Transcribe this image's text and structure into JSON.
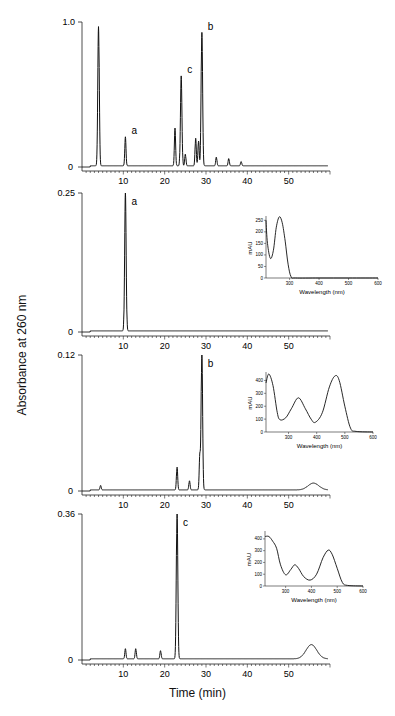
{
  "figure": {
    "ylabel": "Absorbance at 260 nm",
    "xlabel": "Time (min)"
  },
  "chart_data": [
    {
      "type": "line",
      "panel": 1,
      "title": "",
      "xlabel": "Time (min)",
      "ylabel": "Absorbance at 260 nm",
      "xlim": [
        0,
        60
      ],
      "ylim": [
        0,
        1.0
      ],
      "y_ticks": [
        "0",
        "1.0"
      ],
      "x_ticks": [
        "10",
        "20",
        "30",
        "40",
        "50"
      ],
      "annotations": [
        {
          "label": "a",
          "x": 10.5,
          "y": 0.2
        },
        {
          "label": "c",
          "x": 24,
          "y": 0.62
        },
        {
          "label": "b",
          "x": 29,
          "y": 0.92
        }
      ],
      "peaks": [
        {
          "x": 4,
          "y": 0.96
        },
        {
          "x": 10.5,
          "y": 0.2
        },
        {
          "x": 22.5,
          "y": 0.26
        },
        {
          "x": 24,
          "y": 0.62
        },
        {
          "x": 25,
          "y": 0.08
        },
        {
          "x": 27.5,
          "y": 0.19
        },
        {
          "x": 28.2,
          "y": 0.17
        },
        {
          "x": 29,
          "y": 0.92
        },
        {
          "x": 32.5,
          "y": 0.06
        },
        {
          "x": 35.5,
          "y": 0.05
        },
        {
          "x": 38.5,
          "y": 0.03
        }
      ]
    },
    {
      "type": "line",
      "panel": 2,
      "xlim": [
        0,
        60
      ],
      "ylim": [
        0,
        0.25
      ],
      "y_ticks": [
        "0",
        "0.25"
      ],
      "x_ticks": [
        "10",
        "20",
        "30",
        "40",
        "50"
      ],
      "annotations": [
        {
          "label": "a",
          "x": 10.5,
          "y": 0.25
        }
      ],
      "peaks": [
        {
          "x": 10.5,
          "y": 0.25
        }
      ],
      "inset": {
        "type": "line",
        "xlabel": "Wavelength (nm)",
        "ylabel": "mAU",
        "xlim": [
          220,
          600
        ],
        "ylim": [
          0,
          260
        ],
        "x_ticks": [
          "300",
          "400",
          "500",
          "600"
        ],
        "y_ticks": [
          "0",
          "50",
          "100",
          "150",
          "200",
          "250"
        ],
        "x": [
          220,
          225,
          235,
          245,
          255,
          265,
          275,
          285,
          295,
          305,
          320,
          400,
          500,
          600
        ],
        "y": [
          250,
          150,
          85,
          120,
          220,
          265,
          240,
          160,
          60,
          5,
          0,
          0,
          0,
          0
        ]
      }
    },
    {
      "type": "line",
      "panel": 3,
      "xlim": [
        0,
        60
      ],
      "ylim": [
        0,
        0.12
      ],
      "y_ticks": [
        "0",
        "0.12"
      ],
      "x_ticks": [
        "10",
        "20",
        "30",
        "40",
        "50"
      ],
      "annotations": [
        {
          "label": "b",
          "x": 29,
          "y": 0.12
        }
      ],
      "peaks": [
        {
          "x": 4.5,
          "y": 0.004
        },
        {
          "x": 23,
          "y": 0.02
        },
        {
          "x": 26,
          "y": 0.008
        },
        {
          "x": 28.5,
          "y": 0.03
        },
        {
          "x": 29,
          "y": 0.12
        },
        {
          "x": 56,
          "y": 0.006
        }
      ],
      "inset": {
        "type": "line",
        "xlabel": "Wavelength (nm)",
        "ylabel": "mAU",
        "xlim": [
          220,
          600
        ],
        "ylim": [
          0,
          450
        ],
        "x_ticks": [
          "300",
          "400",
          "500",
          "600"
        ],
        "y_ticks": [
          "0",
          "100",
          "200",
          "300",
          "400"
        ],
        "x": [
          220,
          230,
          245,
          260,
          270,
          290,
          310,
          335,
          360,
          380,
          395,
          420,
          445,
          465,
          480,
          500,
          520,
          540,
          600
        ],
        "y": [
          380,
          450,
          360,
          150,
          95,
          110,
          180,
          265,
          180,
          100,
          75,
          150,
          350,
          435,
          400,
          200,
          30,
          5,
          0
        ]
      }
    },
    {
      "type": "line",
      "panel": 4,
      "xlim": [
        0,
        60
      ],
      "ylim": [
        0,
        0.36
      ],
      "y_ticks": [
        "0",
        "0.36"
      ],
      "x_ticks": [
        "10",
        "20",
        "30",
        "40",
        "50"
      ],
      "annotations": [
        {
          "label": "c",
          "x": 23,
          "y": 0.36
        }
      ],
      "peaks": [
        {
          "x": 10.5,
          "y": 0.025
        },
        {
          "x": 13,
          "y": 0.025
        },
        {
          "x": 19,
          "y": 0.02
        },
        {
          "x": 23,
          "y": 0.36
        },
        {
          "x": 55.5,
          "y": 0.035
        }
      ],
      "inset": {
        "type": "line",
        "xlabel": "Wavelength (nm)",
        "ylabel": "mAU",
        "xlim": [
          220,
          600
        ],
        "ylim": [
          0,
          450
        ],
        "x_ticks": [
          "300",
          "400",
          "500",
          "600"
        ],
        "y_ticks": [
          "0",
          "100",
          "200",
          "300",
          "400"
        ],
        "x": [
          220,
          235,
          250,
          265,
          280,
          300,
          320,
          335,
          350,
          370,
          395,
          420,
          445,
          465,
          480,
          500,
          520,
          540,
          600
        ],
        "y": [
          420,
          420,
          380,
          320,
          180,
          95,
          140,
          180,
          150,
          80,
          50,
          100,
          240,
          305,
          270,
          150,
          30,
          5,
          0
        ]
      }
    }
  ]
}
